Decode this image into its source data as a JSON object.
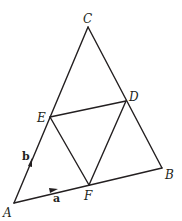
{
  "diagram": {
    "type": "geometry",
    "points": {
      "A": {
        "label": "A"
      },
      "B": {
        "label": "B"
      },
      "C": {
        "label": "C"
      },
      "D": {
        "label": "D"
      },
      "E": {
        "label": "E"
      },
      "F": {
        "label": "F"
      }
    },
    "segments": [
      [
        "A",
        "B"
      ],
      [
        "B",
        "C"
      ],
      [
        "C",
        "A"
      ],
      [
        "E",
        "D"
      ],
      [
        "E",
        "F"
      ],
      [
        "F",
        "D"
      ]
    ],
    "vectors": [
      {
        "label": "a",
        "along": [
          "A",
          "B"
        ]
      },
      {
        "label": "b",
        "along": [
          "A",
          "C"
        ]
      }
    ]
  }
}
